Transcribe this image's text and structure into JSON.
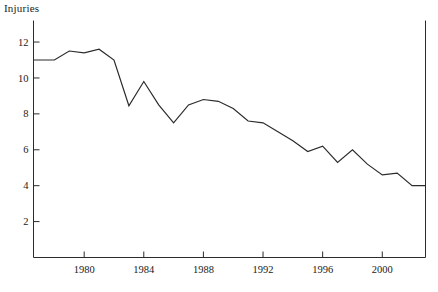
{
  "chart_data": {
    "type": "line",
    "title": "",
    "ylabel": "Injuries",
    "xlabel": "",
    "ylim": [
      0,
      13.2
    ],
    "xlim": [
      1976.6,
      2002.9
    ],
    "grid": false,
    "legend": null,
    "yticks": [
      2,
      4,
      6,
      8,
      10,
      12
    ],
    "ytick_labels": [
      "2",
      "4",
      "6",
      "8",
      "10",
      "12"
    ],
    "xticks": [
      1980,
      1984,
      1988,
      1992,
      1996,
      2000
    ],
    "xtick_labels": [
      "1980",
      "1984",
      "1988",
      "1992",
      "1996",
      "2000"
    ],
    "series": [
      {
        "name": "Injuries",
        "x": [
          1976.6,
          1977,
          1978,
          1979,
          1980,
          1981,
          1982,
          1983,
          1984,
          1985,
          1986,
          1987,
          1988,
          1989,
          1990,
          1991,
          1992,
          1993,
          1994,
          1995,
          1996,
          1997,
          1998,
          1999,
          2000,
          2001,
          2002,
          2002.9
        ],
        "values": [
          11.0,
          11.0,
          11.0,
          11.5,
          11.4,
          11.6,
          11.0,
          8.45,
          9.8,
          8.5,
          7.5,
          8.5,
          8.8,
          8.7,
          8.3,
          7.6,
          7.5,
          7.0,
          6.5,
          5.9,
          6.2,
          5.3,
          6.0,
          5.2,
          4.6,
          4.7,
          4.0,
          4.0
        ]
      }
    ],
    "line_color": "#2b2b2b",
    "axis_color": "#2b2b2b"
  },
  "axes": {
    "title_text": "Injuries"
  }
}
